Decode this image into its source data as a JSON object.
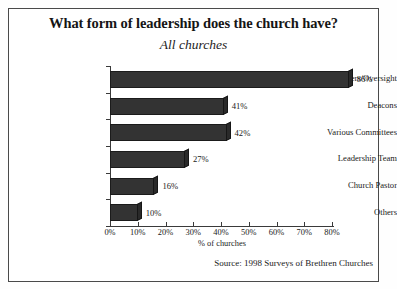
{
  "figure": {
    "title": "What form of leadership does the church have?",
    "subtitle": "All churches",
    "source": "Source: 1998 Surveys of Brethren Churches"
  },
  "chart_data": {
    "type": "bar",
    "orientation": "horizontal",
    "title": "What form of leadership does the church have?",
    "subtitle": "All churches",
    "categories": [
      "Elders/Oversight",
      "Deacons",
      "Various Committees",
      "Leadership Team",
      "Church Pastor",
      "Others"
    ],
    "values": [
      86,
      41,
      42,
      27,
      16,
      10
    ],
    "value_labels": [
      "86%",
      "41%",
      "42%",
      "27%",
      "16%",
      "10%"
    ],
    "xlabel": "% of churches",
    "ylabel": "",
    "xlim": [
      0,
      80
    ],
    "xticks": [
      0,
      10,
      20,
      30,
      40,
      50,
      60,
      70,
      80
    ],
    "xtick_labels": [
      "0%",
      "10%",
      "20%",
      "30%",
      "40%",
      "50%",
      "60%",
      "70%",
      "80%"
    ],
    "grid": false,
    "legend": false,
    "bar_color": "#333333",
    "annotations": [
      "Source: 1998 Surveys of Brethren Churches"
    ]
  }
}
